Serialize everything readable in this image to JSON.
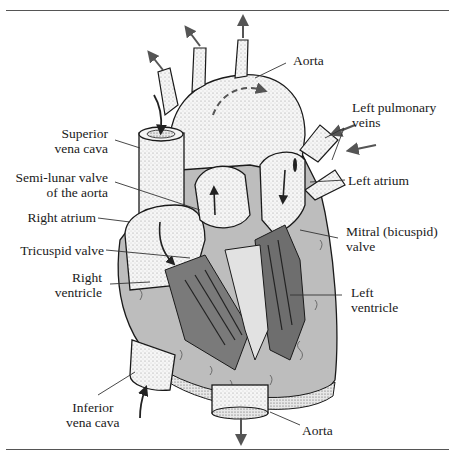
{
  "figure": {
    "colors": {
      "line": "#1a1a1a",
      "vessel_fill": "#f4f4f4",
      "muscle_fill": "#bdbdbd",
      "chamber_wall_fill": "#7a7a7a",
      "arrow": "#555555",
      "rule": "#555555"
    }
  },
  "labels": {
    "aorta_top": {
      "lines": [
        "Aorta"
      ]
    },
    "left_pulmonary_veins": {
      "lines": [
        "Left pulmonary",
        "veins"
      ]
    },
    "superior_vena_cava": {
      "lines": [
        "Superior",
        "vena cava"
      ]
    },
    "semi_lunar_valve": {
      "lines": [
        "Semi-lunar valve",
        "of the aorta"
      ]
    },
    "left_atrium": {
      "lines": [
        "Left atrium"
      ]
    },
    "right_atrium": {
      "lines": [
        "Right atrium"
      ]
    },
    "mitral_valve": {
      "lines": [
        "Mitral (bicuspid)",
        "valve"
      ]
    },
    "tricuspid_valve": {
      "lines": [
        "Tricuspid valve"
      ]
    },
    "right_ventricle": {
      "lines": [
        "Right",
        "ventricle"
      ]
    },
    "left_ventricle": {
      "lines": [
        "Left",
        "ventricle"
      ]
    },
    "inferior_vena_cava": {
      "lines": [
        "Inferior",
        "vena cava"
      ]
    },
    "aorta_bottom": {
      "lines": [
        "Aorta"
      ]
    }
  }
}
